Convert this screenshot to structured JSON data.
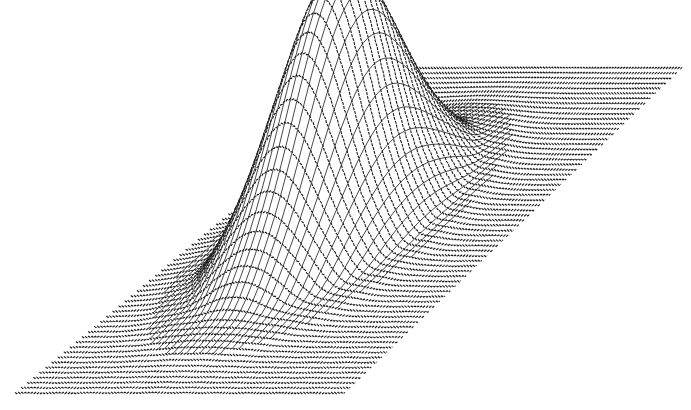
{
  "chart_data": {
    "type": "surface",
    "title": "",
    "xlabel": "",
    "ylabel": "",
    "zlabel": "",
    "grid": false,
    "legend": null,
    "projection": {
      "plane_corners_px": {
        "far_left": [
          405,
          68
        ],
        "far_right": [
          682,
          68
        ],
        "near_left": [
          15,
          393
        ],
        "near_right": [
          345,
          393
        ]
      }
    },
    "grid_resolution": {
      "rows": 64,
      "cols": 48
    },
    "surface": {
      "function": "gaussian_peak_with_ring",
      "peak_center_uv": [
        0.42,
        0.5
      ],
      "peak_height_px": 265,
      "peak_width_u": 0.16,
      "peak_width_v": 0.17,
      "ring_depth_px": -6,
      "ring_radius": 0.3,
      "z_range": [
        -0.03,
        1.0
      ]
    },
    "colors": {
      "background": "#ffffff",
      "line": "#1a1a1a",
      "surface_fill": "#ffffff"
    }
  }
}
